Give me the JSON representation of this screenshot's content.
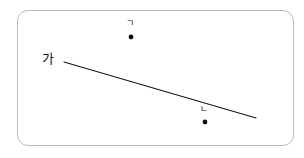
{
  "figure": {
    "background_color": "#ffffff",
    "frame": {
      "name": "rounded-rectangle-border",
      "stroke_color": "#b9b9b9",
      "x": 17,
      "y": 10,
      "width": 277,
      "height": 136,
      "corner_radius": 11
    },
    "line": {
      "label": "가",
      "stroke_color": "#1a1a1a",
      "x1": 64,
      "y1": 62,
      "x2": 256,
      "y2": 118
    },
    "points": [
      {
        "label": "ㄱ",
        "dot_color": "#111111",
        "x": 131,
        "y": 37,
        "radius": 2.4
      },
      {
        "label": "ㄴ",
        "dot_color": "#111111",
        "x": 205,
        "y": 122,
        "radius": 2.4
      }
    ]
  }
}
